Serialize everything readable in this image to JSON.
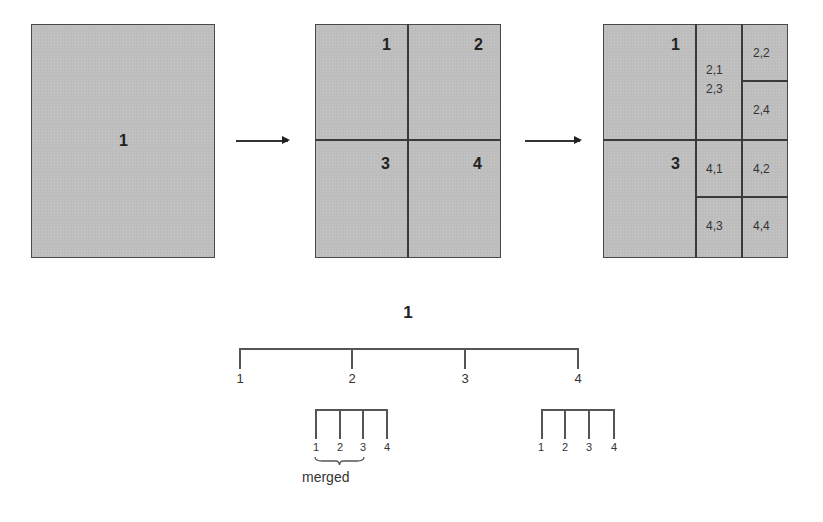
{
  "stage1": {
    "labels": [
      "1"
    ]
  },
  "stage2": {
    "labels": [
      "1",
      "2",
      "3",
      "4"
    ]
  },
  "stage3": {
    "labels": [
      "1",
      "3"
    ],
    "sub_labels": [
      "2,1",
      "2,3",
      "2,2",
      "2,4",
      "4,1",
      "4,2",
      "4,3",
      "4,4"
    ]
  },
  "tree": {
    "root": "1",
    "children": [
      "1",
      "2",
      "3",
      "4"
    ],
    "subtree_left": [
      "1",
      "2",
      "3",
      "4"
    ],
    "subtree_right": [
      "1",
      "2",
      "3",
      "4"
    ],
    "merged_label": "merged"
  },
  "colors": {
    "fill": "#bdbdbd",
    "line": "#3a3a3a"
  }
}
